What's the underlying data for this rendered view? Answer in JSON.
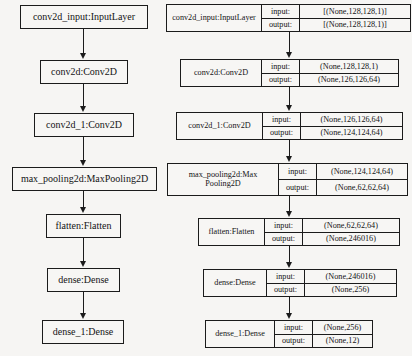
{
  "figure": {
    "type": "neural-network-architecture-diagram",
    "background_color": "#f6f5f3",
    "line_color": "#1b1b1b"
  },
  "simple_graph": {
    "name": "plain-layer-graph",
    "nodes": [
      {
        "id": "conv2d_input",
        "label": "conv2d_input:InputLayer"
      },
      {
        "id": "conv2d",
        "label": "conv2d:Conv2D"
      },
      {
        "id": "conv2d_1",
        "label": "conv2d_1:Conv2D"
      },
      {
        "id": "max_pooling2d",
        "label": "max_pooling2d:MaxPooling2D"
      },
      {
        "id": "flatten",
        "label": "flatten:Flatten"
      },
      {
        "id": "dense",
        "label": "dense:Dense"
      },
      {
        "id": "dense_1",
        "label": "dense_1:Dense"
      }
    ]
  },
  "shaped_graph": {
    "name": "layer-graph-with-shapes",
    "input_label": "input:",
    "output_label": "output:",
    "nodes": [
      {
        "id": "conv2d_input",
        "label": "conv2d_input:InputLayer",
        "label_line1": "conv2d_input:InputLayer",
        "label_line2": "",
        "input_shape": "[(None,128,128,1)]",
        "output_shape": "[(None,128,128,1)]"
      },
      {
        "id": "conv2d",
        "label": "conv2d:Conv2D",
        "label_line1": "conv2d:Conv2D",
        "label_line2": "",
        "input_shape": "(None,128,128,1)",
        "output_shape": "(None,126,126,64)"
      },
      {
        "id": "conv2d_1",
        "label": "conv2d_1:Conv2D",
        "label_line1": "conv2d_1:Conv2D",
        "label_line2": "",
        "input_shape": "(None,126,126,64)",
        "output_shape": "(None,124,124,64)"
      },
      {
        "id": "max_pooling2d",
        "label": "max_pooling2d:MaxPooling2D",
        "label_line1": "max_pooling2d:Max",
        "label_line2": "Pooling2D",
        "input_shape": "(None,124,124,64)",
        "output_shape": "(None,62,62,64)"
      },
      {
        "id": "flatten",
        "label": "flatten:Flatten",
        "label_line1": "flatten:Flatten",
        "label_line2": "",
        "input_shape": "(None,62,62,64)",
        "output_shape": "(None,246016)"
      },
      {
        "id": "dense",
        "label": "dense:Dense",
        "label_line1": "dense:Dense",
        "label_line2": "",
        "input_shape": "(None,246016)",
        "output_shape": "(None,256)"
      },
      {
        "id": "dense_1",
        "label": "dense_1:Dense",
        "label_line1": "dense_1:Dense",
        "label_line2": "",
        "input_shape": "(None,256)",
        "output_shape": "(None,12)"
      }
    ]
  }
}
